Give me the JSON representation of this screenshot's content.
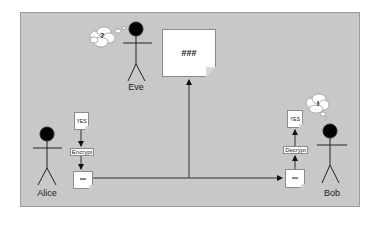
{
  "diagram": {
    "type": "encryption-flow",
    "background_color": "#c8c8c8",
    "actors": [
      {
        "name": "Alice",
        "role": "sender"
      },
      {
        "name": "Eve",
        "role": "eavesdropper",
        "thought": "?"
      },
      {
        "name": "Bob",
        "role": "receiver",
        "thought": "!"
      }
    ],
    "alice": {
      "label": "Alice",
      "plaintext": "YES",
      "operation": "Encrypt",
      "ciphertext": "***"
    },
    "bob": {
      "label": "Bob",
      "plaintext": "YES",
      "operation": "Decrypt",
      "ciphertext": "***",
      "thought": "!"
    },
    "eve": {
      "label": "Eve",
      "thought": "?",
      "intercepted": "###"
    },
    "edges": [
      {
        "from": "alice.plaintext",
        "to": "alice.encrypt"
      },
      {
        "from": "alice.encrypt",
        "to": "alice.ciphertext"
      },
      {
        "from": "alice.ciphertext",
        "to": "bob.ciphertext"
      },
      {
        "from": "channel",
        "to": "eve.intercepted"
      },
      {
        "from": "bob.ciphertext",
        "to": "bob.decrypt"
      },
      {
        "from": "bob.decrypt",
        "to": "bob.plaintext"
      }
    ]
  }
}
